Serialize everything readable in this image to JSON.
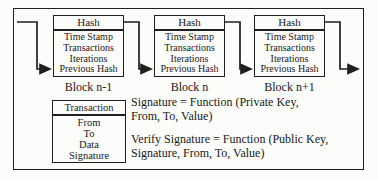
{
  "diagram": {
    "title_semantic": "blockchain-block-structure-diagram",
    "blocks": [
      {
        "header": "Hash",
        "fields": [
          "Time Stamp",
          "Transactions",
          "Iterations",
          "Previous Hash"
        ],
        "label": "Block n-1"
      },
      {
        "header": "Hash",
        "fields": [
          "Time Stamp",
          "Transactions",
          "Iterations",
          "Previous Hash"
        ],
        "label": "Block n"
      },
      {
        "header": "Hash",
        "fields": [
          "Time Stamp",
          "Transactions",
          "Iterations",
          "Previous Hash"
        ],
        "label": "Block n+1"
      }
    ],
    "transaction": {
      "header": "Transaction",
      "fields": [
        "From",
        "To",
        "Data",
        "Signature"
      ]
    },
    "formulas": {
      "signature_line1": "Signature = Function (Private Key,",
      "signature_line2": "From, To, Value)",
      "verify_line1": "Verify Signature = Function (Public Key,",
      "verify_line2": "Signature, From, To, Value)"
    },
    "colors": {
      "line": "#1f1f1f",
      "background": "#fcfcfa",
      "text": "#1a1a1a"
    }
  }
}
